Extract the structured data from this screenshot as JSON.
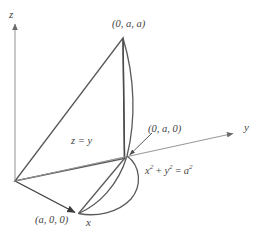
{
  "figure": {
    "type": "3d-solid-diagram",
    "background_color": "#ffffff",
    "line_color": "#4a4a4a",
    "axis_color": "#8a8a8a",
    "text_color": "#3f3f3f"
  },
  "axes": {
    "z": {
      "label": "z",
      "label_x": 10,
      "label_y": 12,
      "from": [
        15,
        181
      ],
      "to": [
        15,
        22
      ]
    },
    "y": {
      "label": "y",
      "label_x": 244,
      "label_y": 123,
      "from": [
        15,
        181
      ],
      "to": [
        236,
        133
      ]
    },
    "x": {
      "label": "x",
      "label_x": 86,
      "label_y": 219,
      "from": [
        15,
        181
      ],
      "to": [
        78,
        214
      ]
    }
  },
  "labels": {
    "apex_point": "(0, a, a)",
    "plane_equation": "z = y",
    "base_point": "(0, a, 0)",
    "cylinder_equation_parts": {
      "x": "x",
      "exp1": "2",
      "plus": " + ",
      "y": "y",
      "exp2": "2",
      "equals": " = ",
      "a": "a",
      "exp3": "2"
    },
    "x_axis_point": "(a, 0, 0)"
  },
  "label_positions": {
    "apex_point": {
      "x": 113,
      "y": 20
    },
    "plane_equation": {
      "x": 71,
      "y": 137
    },
    "base_point": {
      "x": 148,
      "y": 125
    },
    "cylinder_equation": {
      "x": 145,
      "y": 164
    },
    "x_axis_point": {
      "x": 35,
      "y": 216
    }
  },
  "geometry": {
    "origin": [
      15,
      181
    ],
    "apex": [
      123,
      38
    ],
    "base_point_on_y": [
      127,
      157
    ],
    "x_axis_point": [
      78,
      214
    ],
    "cylinder_right_extent": 142,
    "vertical_edge_bottom": [
      124,
      159
    ]
  },
  "leader_line": {
    "from": [
      147,
      131
    ],
    "to": [
      128,
      156
    ]
  }
}
